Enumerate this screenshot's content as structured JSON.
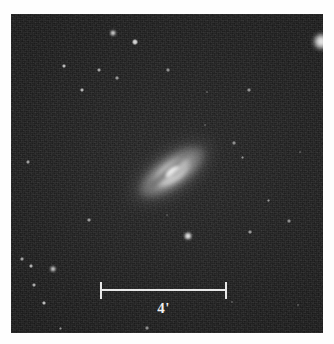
{
  "figure": {
    "type": "astronomical-photograph",
    "background_color": "#242424",
    "border_color": "#ffffff",
    "frame": {
      "x": 11,
      "y": 14,
      "width": 312,
      "height": 319
    }
  },
  "scale_bar": {
    "label": "4'",
    "unit": "arcminutes",
    "value": 4,
    "length_px": 127,
    "x": 100,
    "y": 282,
    "color": "#e8e8e8"
  },
  "galaxy": {
    "center_x": 172,
    "center_y": 172,
    "position_angle_deg": -35,
    "major_axis_px": 104,
    "minor_axis_px": 52,
    "core_color": "#ffffff",
    "has_dust_lane": true
  },
  "stars": [
    {
      "x": 321,
      "y": 41,
      "r": 8.5,
      "brightness": 1.0
    },
    {
      "x": 188,
      "y": 236,
      "r": 4.2,
      "brightness": 0.98
    },
    {
      "x": 113,
      "y": 33,
      "r": 3.4,
      "brightness": 0.95
    },
    {
      "x": 135,
      "y": 42,
      "r": 2.8,
      "brightness": 0.88
    },
    {
      "x": 53,
      "y": 269,
      "r": 2.9,
      "brightness": 0.9
    },
    {
      "x": 64,
      "y": 66,
      "r": 2.4,
      "brightness": 0.78
    },
    {
      "x": 82,
      "y": 90,
      "r": 2.3,
      "brightness": 0.76
    },
    {
      "x": 44,
      "y": 303,
      "r": 2.4,
      "brightness": 0.8
    },
    {
      "x": 31,
      "y": 266,
      "r": 2.2,
      "brightness": 0.74
    },
    {
      "x": 22,
      "y": 259,
      "r": 1.9,
      "brightness": 0.66
    },
    {
      "x": 34,
      "y": 285,
      "r": 2.0,
      "brightness": 0.7
    },
    {
      "x": 99,
      "y": 70,
      "r": 2.0,
      "brightness": 0.68
    },
    {
      "x": 117,
      "y": 78,
      "r": 1.7,
      "brightness": 0.6
    },
    {
      "x": 28,
      "y": 162,
      "r": 1.9,
      "brightness": 0.64
    },
    {
      "x": 89,
      "y": 220,
      "r": 1.8,
      "brightness": 0.62
    },
    {
      "x": 168,
      "y": 70,
      "r": 1.6,
      "brightness": 0.56
    },
    {
      "x": 249,
      "y": 90,
      "r": 1.7,
      "brightness": 0.58
    },
    {
      "x": 234,
      "y": 143,
      "r": 1.6,
      "brightness": 0.55
    },
    {
      "x": 242,
      "y": 157,
      "r": 1.5,
      "brightness": 0.52
    },
    {
      "x": 268,
      "y": 200,
      "r": 1.5,
      "brightness": 0.52
    },
    {
      "x": 289,
      "y": 221,
      "r": 1.6,
      "brightness": 0.54
    },
    {
      "x": 250,
      "y": 232,
      "r": 1.8,
      "brightness": 0.6
    },
    {
      "x": 207,
      "y": 92,
      "r": 1.4,
      "brightness": 0.46
    },
    {
      "x": 147,
      "y": 328,
      "r": 1.6,
      "brightness": 0.54
    },
    {
      "x": 60,
      "y": 328,
      "r": 1.5,
      "brightness": 0.5
    },
    {
      "x": 232,
      "y": 302,
      "r": 1.4,
      "brightness": 0.46
    },
    {
      "x": 298,
      "y": 305,
      "r": 1.3,
      "brightness": 0.44
    },
    {
      "x": 205,
      "y": 125,
      "r": 1.3,
      "brightness": 0.42
    },
    {
      "x": 300,
      "y": 152,
      "r": 1.3,
      "brightness": 0.42
    },
    {
      "x": 167,
      "y": 215,
      "r": 1.2,
      "brightness": 0.38
    }
  ]
}
